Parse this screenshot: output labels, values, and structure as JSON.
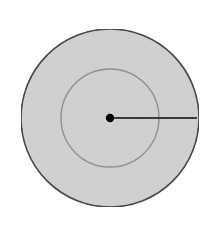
{
  "diagram": {
    "type": "concentric-circles",
    "width": 211,
    "height": 229,
    "center": {
      "x": 110,
      "y": 118
    },
    "outer_circle": {
      "r": 89,
      "fill": "#d6d6d6",
      "stroke": "#4a4a4a",
      "stroke_width": 1.6
    },
    "inner_circle": {
      "r": 49,
      "fill": "#dadada",
      "stroke": "#8f8f8f",
      "stroke_width": 1.4
    },
    "center_point": {
      "r": 4.2,
      "fill": "#000000"
    },
    "radius_line": {
      "x2": 197,
      "stroke": "#3a3a3a",
      "stroke_width": 1.8
    },
    "background": "#ffffff"
  }
}
